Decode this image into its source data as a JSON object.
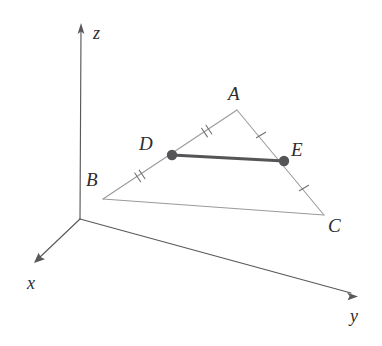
{
  "figure": {
    "width": 382,
    "height": 346,
    "background": "#ffffff"
  },
  "colors": {
    "axis": "#59595b",
    "triangle_edge": "#9a9a9c",
    "midsegment": "#555558",
    "vertex_dot": "#555558",
    "tick": "#6f6f72",
    "label_text": "#2c2c2e"
  },
  "axes": {
    "origin": {
      "x": 80,
      "y": 219
    },
    "items": [
      {
        "name": "z",
        "label": "z",
        "label_pos": {
          "x": 93,
          "y": 24
        },
        "tip": {
          "x": 81,
          "y": 24
        },
        "tail": {
          "x": 80,
          "y": 219
        }
      },
      {
        "name": "x",
        "label": "x",
        "label_pos": {
          "x": 27,
          "y": 274
        },
        "tip": {
          "x": 35,
          "y": 262
        },
        "tail": {
          "x": 80,
          "y": 219
        }
      },
      {
        "name": "y",
        "label": "y",
        "label_pos": {
          "x": 350,
          "y": 307
        },
        "tip": {
          "x": 357,
          "y": 296
        },
        "tail": {
          "x": 80,
          "y": 219
        }
      }
    ]
  },
  "triangle": {
    "edges": [
      "AB",
      "AC",
      "BC"
    ],
    "vertices": [
      {
        "name": "A",
        "label": "A",
        "x": 237,
        "y": 110,
        "label_pos": {
          "x": 228,
          "y": 84
        },
        "dot": false
      },
      {
        "name": "B",
        "label": "B",
        "x": 103,
        "y": 199,
        "label_pos": {
          "x": 86,
          "y": 170
        },
        "dot": false
      },
      {
        "name": "C",
        "label": "C",
        "x": 324,
        "y": 215,
        "label_pos": {
          "x": 328,
          "y": 216
        },
        "dot": false
      }
    ],
    "midpoints": [
      {
        "name": "D",
        "label": "D",
        "x": 172,
        "y": 155,
        "label_pos": {
          "x": 139,
          "y": 134
        },
        "dot": true,
        "on_edge": "AB"
      },
      {
        "name": "E",
        "label": "E",
        "x": 284,
        "y": 161,
        "label_pos": {
          "x": 291,
          "y": 140
        },
        "dot": true,
        "on_edge": "AC"
      }
    ],
    "midsegment": {
      "name": "DE",
      "from": "D",
      "to": "E",
      "emphasized": true
    }
  },
  "tick_marks": [
    {
      "name": "tick-AD",
      "segment": "AD",
      "count": 2,
      "x": 205,
      "y": 132
    },
    {
      "name": "tick-DB",
      "segment": "DB",
      "count": 2,
      "x": 138,
      "y": 177
    },
    {
      "name": "tick-AE",
      "segment": "AE",
      "count": 1,
      "x": 261,
      "y": 135
    },
    {
      "name": "tick-EC",
      "segment": "EC",
      "count": 1,
      "x": 304,
      "y": 188
    }
  ]
}
